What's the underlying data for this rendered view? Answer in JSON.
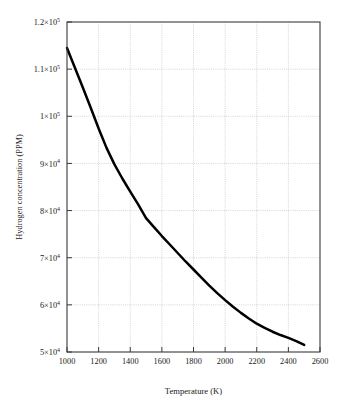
{
  "chart_data": {
    "type": "line",
    "title": "",
    "subtitle": "",
    "xlabel": "Temperature (K)",
    "ylabel": "Hydrogen concentration (PPM)",
    "xlim": [
      1000,
      2600
    ],
    "ylim": [
      50000,
      120000
    ],
    "grid": true,
    "legend": null,
    "legend_position": "none",
    "xticks": [
      1000,
      1200,
      1400,
      1600,
      1800,
      2000,
      2200,
      2400,
      2600
    ],
    "xticklabels": [
      "1000",
      "1200",
      "1400",
      "1600",
      "1800",
      "2000",
      "2200",
      "2400",
      "2600"
    ],
    "yticks": [
      50000,
      60000,
      70000,
      80000,
      90000,
      100000,
      110000,
      120000
    ],
    "yticklabels": [
      {
        "mantissa": "5×10",
        "exponent": "4"
      },
      {
        "mantissa": "6×10",
        "exponent": "4"
      },
      {
        "mantissa": "7×10",
        "exponent": "4"
      },
      {
        "mantissa": "8×10",
        "exponent": "4"
      },
      {
        "mantissa": "9×10",
        "exponent": "4"
      },
      {
        "mantissa": "1×10",
        "exponent": "5"
      },
      {
        "mantissa": "1.1×10",
        "exponent": "5"
      },
      {
        "mantissa": "1.2×10",
        "exponent": "5"
      }
    ],
    "series": [
      {
        "name": "Hydrogen concentration",
        "color": "#000000",
        "x": [
          1000,
          1050,
          1100,
          1150,
          1200,
          1250,
          1300,
          1350,
          1400,
          1450,
          1500,
          1550,
          1600,
          1650,
          1700,
          1750,
          1800,
          1850,
          1900,
          1950,
          2000,
          2050,
          2100,
          2150,
          2200,
          2250,
          2300,
          2350,
          2400,
          2450,
          2500
        ],
        "values": [
          114500,
          110300,
          106100,
          101800,
          97400,
          93300,
          89800,
          86800,
          84000,
          81300,
          78400,
          76500,
          74600,
          72800,
          71000,
          69200,
          67500,
          65800,
          64100,
          62500,
          61000,
          59600,
          58300,
          57100,
          56000,
          55100,
          54300,
          53600,
          53000,
          52300,
          51500
        ]
      }
    ]
  },
  "axis_titles": {
    "x": "Temperature (K)",
    "y": "Hydrogen concentration (PPM)"
  }
}
